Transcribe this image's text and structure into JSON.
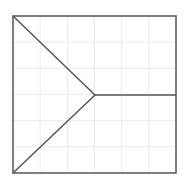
{
  "diagram": {
    "frame": {
      "x": 13,
      "y": 16,
      "width": 163,
      "height": 157
    },
    "grid": {
      "cols": 6,
      "rows": 6,
      "color": "#ebebeb"
    },
    "stroke_color": "#555555",
    "center": {
      "x": 95,
      "y": 95
    },
    "segments": [
      {
        "name": "diagonal-top-left-to-center",
        "from": [
          13,
          16
        ],
        "to": [
          95,
          95
        ]
      },
      {
        "name": "diagonal-bottom-left-to-center",
        "from": [
          13,
          173
        ],
        "to": [
          95,
          95
        ]
      },
      {
        "name": "horizontal-center-to-right",
        "from": [
          95,
          95
        ],
        "to": [
          176,
          95
        ]
      }
    ]
  }
}
